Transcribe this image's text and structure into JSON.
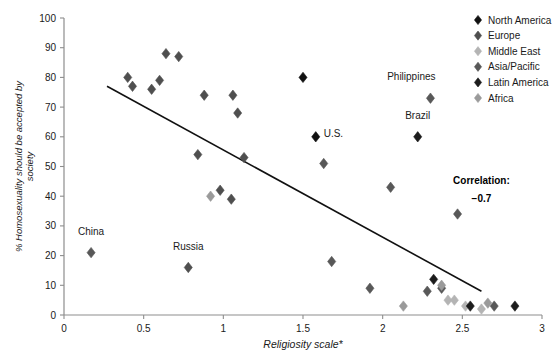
{
  "chart_data": {
    "type": "scatter",
    "title": "",
    "xlabel": "Religiosity scale*",
    "ylabel": "% Homosexuality should be accepted by society",
    "xlim": [
      0,
      3
    ],
    "ylim": [
      0,
      100
    ],
    "xticks": [
      "0",
      "0.5",
      "1",
      "1.5",
      "2",
      "2.5",
      "3"
    ],
    "xtick_values": [
      0,
      0.5,
      1,
      1.5,
      2,
      2.5,
      3
    ],
    "yticks": [
      "0",
      "10",
      "20",
      "30",
      "40",
      "50",
      "60",
      "70",
      "80",
      "90",
      "100"
    ],
    "ytick_values": [
      0,
      10,
      20,
      30,
      40,
      50,
      60,
      70,
      80,
      90,
      100
    ],
    "grid": false,
    "legend_position": "top-right",
    "annotations": [
      {
        "text": "China",
        "x": 0.17,
        "y": 27
      },
      {
        "text": "Russia",
        "x": 0.78,
        "y": 22
      },
      {
        "text": "U.S.",
        "x": 1.63,
        "y": 60
      },
      {
        "text": "Brazil",
        "x": 2.22,
        "y": 66
      },
      {
        "text": "Philippines",
        "x": 2.18,
        "y": 79
      },
      {
        "text": "Correlation:",
        "x": 2.62,
        "y": 44
      },
      {
        "text": "−0.7",
        "x": 2.62,
        "y": 38
      }
    ],
    "correlation_label": "Correlation:",
    "correlation_value": "−0.7",
    "trendline": {
      "x1": 0.27,
      "y1": 77,
      "x2": 2.62,
      "y2": 8
    },
    "series": [
      {
        "name": "North America",
        "color": "#111111",
        "points": [
          {
            "x": 1.5,
            "y": 80
          },
          {
            "x": 1.58,
            "y": 60
          }
        ]
      },
      {
        "name": "Europe",
        "color": "#4f4f4f",
        "points": [
          {
            "x": 0.4,
            "y": 80
          },
          {
            "x": 0.43,
            "y": 77
          },
          {
            "x": 0.55,
            "y": 76
          },
          {
            "x": 0.64,
            "y": 88
          },
          {
            "x": 0.6,
            "y": 79
          },
          {
            "x": 0.72,
            "y": 87
          },
          {
            "x": 0.88,
            "y": 74
          },
          {
            "x": 1.06,
            "y": 74
          },
          {
            "x": 1.09,
            "y": 68
          },
          {
            "x": 0.84,
            "y": 54
          },
          {
            "x": 1.13,
            "y": 53
          },
          {
            "x": 0.98,
            "y": 42
          },
          {
            "x": 1.05,
            "y": 39
          },
          {
            "x": 0.78,
            "y": 16
          }
        ]
      },
      {
        "name": "Middle East",
        "color": "#b4b4b4",
        "points": [
          {
            "x": 2.41,
            "y": 5
          },
          {
            "x": 2.45,
            "y": 5
          },
          {
            "x": 2.52,
            "y": 3
          },
          {
            "x": 2.62,
            "y": 2
          }
        ]
      },
      {
        "name": "Asia/Pacific",
        "color": "#585858",
        "points": [
          {
            "x": 0.17,
            "y": 21
          },
          {
            "x": 1.63,
            "y": 51
          },
          {
            "x": 2.05,
            "y": 43
          },
          {
            "x": 2.3,
            "y": 73
          },
          {
            "x": 2.47,
            "y": 34
          },
          {
            "x": 1.68,
            "y": 18
          },
          {
            "x": 1.92,
            "y": 9
          },
          {
            "x": 2.28,
            "y": 8
          },
          {
            "x": 2.37,
            "y": 9
          },
          {
            "x": 2.7,
            "y": 3
          }
        ]
      },
      {
        "name": "Latin America",
        "color": "#1c1c1c",
        "points": [
          {
            "x": 2.22,
            "y": 60
          },
          {
            "x": 2.32,
            "y": 12
          },
          {
            "x": 2.55,
            "y": 3
          },
          {
            "x": 2.83,
            "y": 3
          }
        ]
      },
      {
        "name": "Africa",
        "color": "#9a9a9a",
        "points": [
          {
            "x": 0.92,
            "y": 40
          },
          {
            "x": 2.13,
            "y": 3
          },
          {
            "x": 2.37,
            "y": 10
          },
          {
            "x": 2.66,
            "y": 4
          }
        ]
      }
    ]
  },
  "legend": {
    "items": [
      {
        "label": "North America",
        "color": "#111111"
      },
      {
        "label": "Europe",
        "color": "#4f4f4f"
      },
      {
        "label": "Middle East",
        "color": "#b4b4b4"
      },
      {
        "label": "Asia/Pacific",
        "color": "#585858"
      },
      {
        "label": "Latin America",
        "color": "#1c1c1c"
      },
      {
        "label": "Africa",
        "color": "#9a9a9a"
      }
    ]
  }
}
